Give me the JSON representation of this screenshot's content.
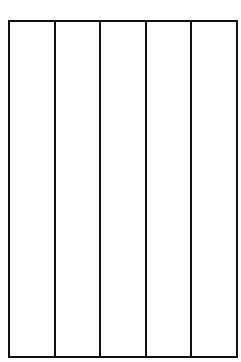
{
  "diagram": {
    "type": "empty-column-grid",
    "columns": 5,
    "rows": 1,
    "cells": [
      "",
      "",
      "",
      "",
      ""
    ],
    "line_color": "#111111",
    "background": "#ffffff"
  }
}
